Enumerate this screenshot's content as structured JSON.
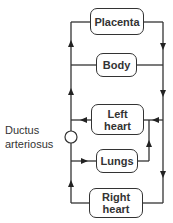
{
  "diagram": {
    "nodes": {
      "placenta": "Placenta",
      "body": "Body",
      "left_heart_line1": "Left",
      "left_heart_line2": "heart",
      "lungs": "Lungs",
      "right_heart_line1": "Right",
      "right_heart_line2": "heart"
    },
    "label_ductus_line1": "Ductus",
    "label_ductus_line2": "arteriosus",
    "line_color": "#333333"
  }
}
